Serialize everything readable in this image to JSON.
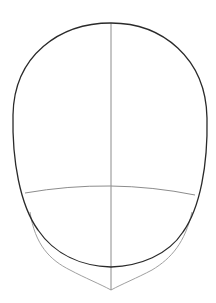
{
  "diagram": {
    "background": "#ffffff",
    "colors": {
      "outline": "#2a2a2a",
      "guide": "#8c8c8c",
      "jaw_guide": "#a0a0a0"
    },
    "shapes": {
      "head_outline": "M111,23 C60,23 14,55 13,115 C12,160 20,205 38,230 C55,255 82,266 111,267 C140,266 168,255 183,232 C200,208 208,165 207,118 C206,58 162,23 111,23 Z",
      "center_line": "M111,23 L111,290",
      "brow_line": "M25,193 Q111,178 195,195",
      "jaw_line": "M30,212 C35,245 50,260 70,270 C85,278 100,284 111,290 C122,284 137,278 152,270 C172,258 185,242 192,212"
    }
  }
}
